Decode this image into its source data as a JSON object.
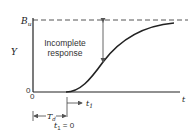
{
  "diagram": {
    "title": "",
    "y_axis_label": "Y",
    "x_axis_label": "t",
    "upper_level_label": "B",
    "upper_level_subscript": "u",
    "origin_y_label": "0",
    "origin_x_label": "0",
    "annotation": {
      "line1": "Incomplete",
      "line2": "response"
    },
    "delay_label": "T",
    "delay_subscript": "d",
    "time_shift_label": "t",
    "time_shift_subscript": "1",
    "time_zero_label_var": "t",
    "time_zero_label_sub": "1",
    "time_zero_label_eq": " = 0",
    "colors": {
      "line": "#222222",
      "dashed": "#555555",
      "arrow": "#666666"
    }
  }
}
